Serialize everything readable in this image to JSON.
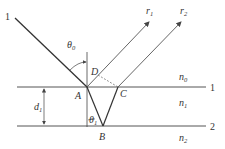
{
  "diagram": {
    "type": "thin-film reflection geometry",
    "incident_ray_label": "1",
    "interfaces": [
      {
        "id": "interface-1",
        "label": "1"
      },
      {
        "id": "interface-2",
        "label": "2"
      }
    ],
    "media": [
      {
        "symbol": "n",
        "subscript": "0"
      },
      {
        "symbol": "n",
        "subscript": "1"
      },
      {
        "symbol": "n",
        "subscript": "2"
      }
    ],
    "points": {
      "A": "A",
      "B": "B",
      "C": "C",
      "D": "D"
    },
    "rays": [
      {
        "symbol": "r",
        "subscript": "1"
      },
      {
        "symbol": "r",
        "subscript": "2"
      }
    ],
    "angles": [
      {
        "symbol": "θ",
        "subscript": "0"
      },
      {
        "symbol": "θ",
        "subscript": "1"
      }
    ],
    "thickness": {
      "symbol": "d",
      "subscript": "1"
    },
    "colors": {
      "line": "#444444",
      "text": "#333333",
      "background": "#ffffff"
    }
  }
}
